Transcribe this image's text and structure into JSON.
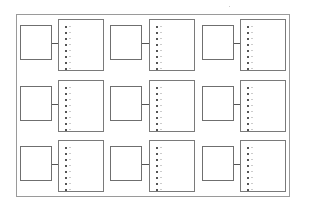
{
  "diagram": {
    "frame": {
      "x": 16,
      "y": 14,
      "w": 274,
      "h": 183
    },
    "dots_per_list": 8,
    "rows": [
      {
        "y_left": 25,
        "y_right": 19
      },
      {
        "y_left": 86,
        "y_right": 80
      },
      {
        "y_left": 146,
        "y_right": 140
      }
    ],
    "columns": [
      {
        "x_left": 20,
        "x_right": 58
      },
      {
        "x_left": 110,
        "x_right": 149
      },
      {
        "x_left": 202,
        "x_right": 240
      }
    ],
    "left_box": {
      "w": 32,
      "h": 35
    },
    "right_box": {
      "w": 46,
      "h": 52
    },
    "colors": {
      "border": "#6f6f6f",
      "frame": "#9a9a9a",
      "dot": "#555555"
    }
  }
}
